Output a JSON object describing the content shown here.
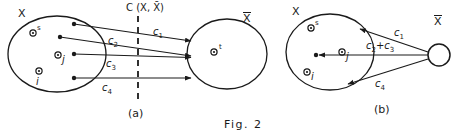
{
  "figure": {
    "caption": "Fig. 2",
    "panels": [
      {
        "id": "a",
        "label": "(a)",
        "source_set_label": "X",
        "sink_set_label": "X̄",
        "cut_label": "C (X, X̄)",
        "source_nodes": [
          {
            "name": "s",
            "label": "s"
          },
          {
            "name": "j",
            "label": "j"
          },
          {
            "name": "i",
            "label": "i"
          }
        ],
        "sink_nodes": [
          {
            "name": "t",
            "label": "t"
          }
        ],
        "edges": [
          {
            "name": "c1",
            "label_base": "c",
            "label_sub": "1"
          },
          {
            "name": "c2",
            "label_base": "c",
            "label_sub": "2"
          },
          {
            "name": "c3",
            "label_base": "c",
            "label_sub": "3"
          },
          {
            "name": "c4",
            "label_base": "c",
            "label_sub": "4"
          }
        ]
      },
      {
        "id": "b",
        "label": "(b)",
        "source_set_label": "X",
        "sink_set_label": "X̄",
        "source_nodes": [
          {
            "name": "s",
            "label": "s"
          },
          {
            "name": "j",
            "label": "j"
          },
          {
            "name": "i",
            "label": "i"
          }
        ],
        "edges": [
          {
            "name": "c1",
            "label_base": "c",
            "label_sub": "1"
          },
          {
            "name": "c2-plus-c3",
            "label_base": "c",
            "label_sub": "2",
            "label_mid": "+c",
            "label_sub2": "3"
          },
          {
            "name": "c4",
            "label_base": "c",
            "label_sub": "4"
          }
        ]
      }
    ]
  },
  "colors": {
    "stroke": "#1a1a1a",
    "background": "#ffffff"
  }
}
